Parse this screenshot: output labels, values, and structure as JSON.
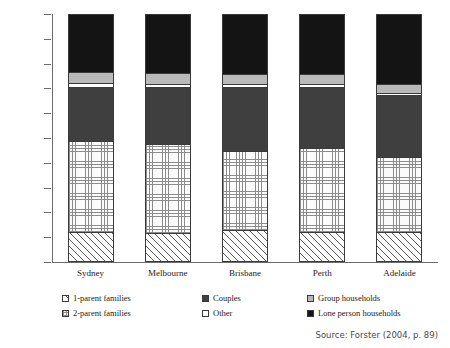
{
  "chart_data": {
    "type": "bar",
    "subtype": "stacked-percentage-column",
    "title": "",
    "xlabel": "",
    "ylabel": "",
    "ylim": [
      0,
      100
    ],
    "grid": false,
    "legend_position": "bottom",
    "categories": [
      "Sydney",
      "Melbourne",
      "Brisbane",
      "Perth",
      "Adelaide"
    ],
    "tick_labels": [
      "0%",
      "10%",
      "20%",
      "30%",
      "40%",
      "50%",
      "60%",
      "70%",
      "80%",
      "90%",
      "100%"
    ],
    "tick_values": [
      0,
      10,
      20,
      30,
      40,
      50,
      60,
      70,
      80,
      90,
      100
    ],
    "series": [
      {
        "name": "1-parent families",
        "pattern": "diagonal-hatch",
        "values": [
          11.5,
          11.0,
          12.0,
          11.5,
          11.5
        ]
      },
      {
        "name": "2-parent families",
        "pattern": "fine-grid-dots",
        "values": [
          37.0,
          36.0,
          32.5,
          34.0,
          30.5
        ]
      },
      {
        "name": "Couples",
        "pattern": "dark-gray-solid",
        "values": [
          22.0,
          23.5,
          26.0,
          25.0,
          25.0
        ]
      },
      {
        "name": "Other",
        "pattern": "white-solid",
        "values": [
          1.5,
          1.0,
          1.0,
          1.0,
          1.0
        ]
      },
      {
        "name": "Group households",
        "pattern": "light-gray-solid",
        "values": [
          4.5,
          4.5,
          4.0,
          4.0,
          3.5
        ]
      },
      {
        "name": "Lone person households",
        "pattern": "black-solid",
        "values": [
          23.5,
          24.0,
          24.5,
          24.5,
          28.5
        ]
      }
    ],
    "colors": {
      "1-parent families": "#ffffff",
      "2-parent families": "#fbfbfb",
      "Couples": "#3f3f3f",
      "Other": "#ffffff",
      "Group households": "#b9b9b9",
      "Lone person households": "#141414",
      "axis": "#6b6b6b",
      "outline": "#3a3a3a"
    },
    "source": "Source: Forster (2004, p. 89)"
  },
  "legend": {
    "items": [
      {
        "label": "1-parent families",
        "swatch": "swatch-1parent"
      },
      {
        "label": "2-parent families",
        "swatch": "swatch-2parent"
      },
      {
        "label": "Couples",
        "swatch": "swatch-couples"
      },
      {
        "label": "Other",
        "swatch": "swatch-other"
      },
      {
        "label": "Group households",
        "swatch": "swatch-group"
      },
      {
        "label": "Lone person households",
        "swatch": "swatch-lone"
      }
    ]
  },
  "source_note": "Source: Forster (2004, p. 89)"
}
